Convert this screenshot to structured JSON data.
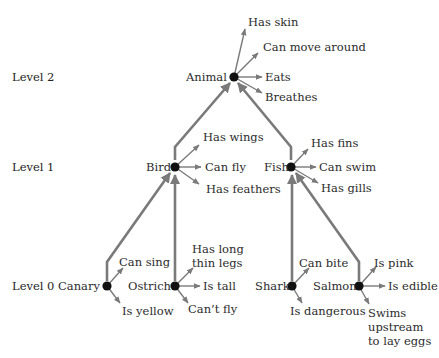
{
  "diagram": {
    "type": "semantic-network hierarchy",
    "colors": {
      "edge": "#7a7a7a",
      "node": "#111111",
      "text": "#2b2b2b"
    },
    "levels": [
      {
        "id": "level2",
        "label": "Level 2"
      },
      {
        "id": "level1",
        "label": "Level 1"
      },
      {
        "id": "level0",
        "label": "Level 0"
      }
    ],
    "nodes": {
      "animal": {
        "name": "Animal",
        "level": 2,
        "properties": [
          "Has skin",
          "Can move around",
          "Eats",
          "Breathes"
        ]
      },
      "bird": {
        "name": "Bird",
        "level": 1,
        "parent": "Animal",
        "properties": [
          "Has wings",
          "Can fly",
          "Has feathers"
        ]
      },
      "fish": {
        "name": "Fish",
        "level": 1,
        "parent": "Animal",
        "properties": [
          "Has fins",
          "Can swim",
          "Has gills"
        ]
      },
      "canary": {
        "name": "Canary",
        "level": 0,
        "parent": "Bird",
        "properties": [
          "Can sing",
          "Is yellow"
        ]
      },
      "ostrich": {
        "name": "Ostrich",
        "level": 0,
        "parent": "Bird",
        "properties": [
          "Has long\nthin legs",
          "Is tall",
          "Can’t fly"
        ]
      },
      "shark": {
        "name": "Shark",
        "level": 0,
        "parent": "Fish",
        "properties": [
          "Can bite",
          "Is dangerous"
        ]
      },
      "salmon": {
        "name": "Salmon",
        "level": 0,
        "parent": "Fish",
        "properties": [
          "Is pink",
          "Is edible",
          "Swims\nupstream\nto lay eggs"
        ]
      }
    }
  }
}
